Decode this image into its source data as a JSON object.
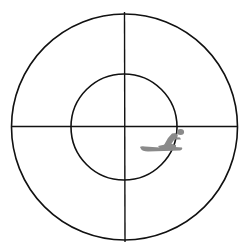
{
  "diagram": {
    "type": "target-reticle",
    "background": "#ffffff",
    "stroke_color": "#111111",
    "outer_circle": {
      "cx": 124.5,
      "cy": 127,
      "r": 113
    },
    "inner_circle": {
      "cx": 124,
      "cy": 127,
      "r": 53
    },
    "crosshair": {
      "vertical": {
        "x": 124.5,
        "y1": 12,
        "y2": 242
      },
      "horizontal": {
        "y": 126.5,
        "x1": 12,
        "x2": 237
      }
    },
    "marker": {
      "icon": "snowmobile-rider-icon",
      "color": "#8a8a8a",
      "position": "lower-right quadrant, just right of center, straddling inner circle"
    }
  }
}
